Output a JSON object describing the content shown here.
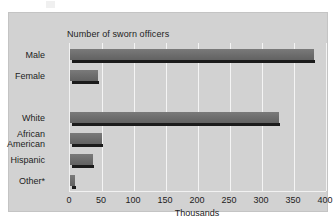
{
  "chart_data": {
    "type": "bar",
    "orientation": "horizontal",
    "title": "Number of sworn officers",
    "xlabel": "Thousands",
    "ylabel": "",
    "xlim": [
      0,
      400
    ],
    "xticks": [
      0,
      50,
      100,
      150,
      200,
      250,
      300,
      350,
      400
    ],
    "xtick_labels": [
      "0",
      "50",
      "100",
      "150",
      "200",
      "250",
      "300",
      "350",
      "400"
    ],
    "grid": "vertical",
    "legend": "none",
    "categories": [
      "Male",
      "Female",
      "White",
      "African American",
      "Hispanic",
      "Other*"
    ],
    "values": [
      381,
      44,
      327,
      50,
      36,
      8
    ],
    "bars": [
      {
        "label": "Male",
        "label_lines": [
          "Male"
        ],
        "value": 381,
        "row": 0
      },
      {
        "label": "Female",
        "label_lines": [
          "Female"
        ],
        "value": 44,
        "row": 1
      },
      {
        "label": "White",
        "label_lines": [
          "White"
        ],
        "value": 327,
        "row": 3
      },
      {
        "label": "African American",
        "label_lines": [
          "African",
          "American"
        ],
        "value": 50,
        "row": 4
      },
      {
        "label": "Hispanic",
        "label_lines": [
          "Hispanic"
        ],
        "value": 36,
        "row": 5
      },
      {
        "label": "Other*",
        "label_lines": [
          "Other*"
        ],
        "value": 8,
        "row": 6
      }
    ],
    "colors": {
      "bar": "#6e6e6e",
      "bar_shadow": "#1b1b1b",
      "panel_background": "#d2d2d2",
      "gridline": "#f4f4f4",
      "text": "#1d1d1d",
      "page_background": "#ffffff"
    }
  }
}
